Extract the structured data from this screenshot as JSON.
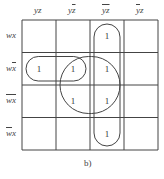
{
  "columns": [
    {
      "a": "y",
      "a_bar": false,
      "b": "z",
      "b_bar": false,
      "text": "yz"
    },
    {
      "a": "y",
      "a_bar": false,
      "b": "z",
      "b_bar": true,
      "text": "yz̄"
    },
    {
      "a": "y",
      "a_bar": true,
      "b": "z",
      "b_bar": true,
      "text": "ȳz̄"
    },
    {
      "a": "y",
      "a_bar": true,
      "b": "z",
      "b_bar": false,
      "text": "ȳz"
    }
  ],
  "rows": [
    {
      "a": "w",
      "a_bar": false,
      "b": "x",
      "b_bar": false,
      "text": "wx"
    },
    {
      "a": "w",
      "a_bar": false,
      "b": "x",
      "b_bar": true,
      "text": "wx̄"
    },
    {
      "a": "w",
      "a_bar": true,
      "b": "x",
      "b_bar": true,
      "text": "w̄x̄"
    },
    {
      "a": "w",
      "a_bar": true,
      "b": "x",
      "b_bar": false,
      "text": "w̄x"
    }
  ],
  "cells": [
    [
      "",
      "",
      "1",
      ""
    ],
    [
      "1",
      "1",
      "1",
      ""
    ],
    [
      "",
      "1",
      "1",
      ""
    ],
    [
      "",
      "",
      "1",
      ""
    ]
  ],
  "groups": [
    {
      "name": "column-ybar-zbar",
      "rows": [
        0,
        3
      ],
      "cols": [
        2,
        2
      ]
    },
    {
      "name": "row-w-xbar-pair",
      "rows": [
        1,
        1
      ],
      "cols": [
        0,
        1
      ]
    },
    {
      "name": "square-xbar-zbar",
      "rows": [
        1,
        2
      ],
      "cols": [
        1,
        2
      ]
    }
  ],
  "caption": "b)"
}
